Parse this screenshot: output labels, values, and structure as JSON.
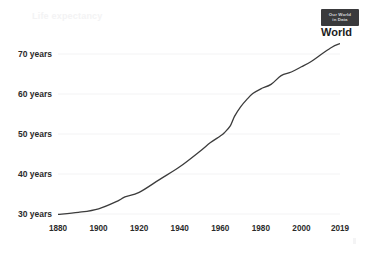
{
  "logo": {
    "line1": "Our World",
    "line2": "in Data",
    "bg": "#3a3a3c",
    "fg": "#d8d8da"
  },
  "header": {
    "title": "Life expectancy",
    "subtitle": ""
  },
  "series_label": "World",
  "chart_data": {
    "type": "line",
    "title": "Life expectancy",
    "xlabel": "",
    "ylabel": "",
    "xlim": [
      1880,
      2019
    ],
    "ylim": [
      29.5,
      74.5
    ],
    "grid": true,
    "legend_position": "line-end",
    "line_color": "#3c3c3c",
    "x_ticks": [
      "1880",
      "1900",
      "1920",
      "1940",
      "1960",
      "1980",
      "2000",
      "2019"
    ],
    "x_tick_values": [
      1880,
      1900,
      1920,
      1940,
      1960,
      1980,
      2000,
      2019
    ],
    "y_ticks": [
      "30 years",
      "40 years",
      "50 years",
      "60 years",
      "70 years"
    ],
    "y_tick_values": [
      30,
      40,
      50,
      60,
      70
    ],
    "series": [
      {
        "name": "World",
        "x": [
          1880,
          1890,
          1900,
          1910,
          1913,
          1920,
          1930,
          1940,
          1950,
          1955,
          1960,
          1962,
          1965,
          1967,
          1970,
          1973,
          1976,
          1980,
          1985,
          1990,
          1995,
          2000,
          2005,
          2010,
          2015,
          2019
        ],
        "values": [
          29.9,
          30.4,
          31.3,
          33.4,
          34.3,
          35.4,
          38.6,
          41.8,
          45.7,
          47.8,
          49.5,
          50.3,
          52.1,
          54.4,
          56.8,
          58.6,
          60.1,
          61.3,
          62.4,
          64.6,
          65.5,
          66.8,
          68.2,
          70.0,
          71.7,
          72.6
        ]
      }
    ]
  }
}
